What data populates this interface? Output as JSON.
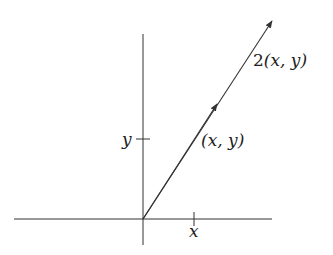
{
  "diagram": {
    "title": "",
    "labels": {
      "scaled_vector": {
        "pre": "2",
        "text": "(x, y)"
      },
      "vector": "(x, y)",
      "y_tick": "y",
      "x_tick": "x"
    },
    "colors": {
      "stroke": "#333333",
      "background": "#ffffff"
    },
    "geometry": {
      "origin": [
        143,
        219
      ],
      "x_axis": [
        14,
        272
      ],
      "y_axis": [
        34,
        245
      ],
      "vector_tip": [
        272,
        22
      ],
      "midpoint_arrow": [
        217,
        104
      ],
      "x_tick_pos": 194,
      "y_tick_pos": 139
    }
  }
}
